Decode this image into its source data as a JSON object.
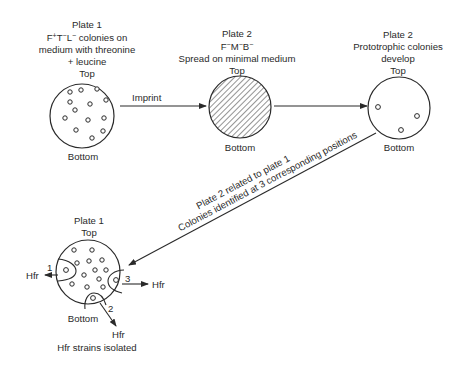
{
  "plate1_top": {
    "title": "Plate 1",
    "genotype": {
      "F": "F",
      "F_sup": "+",
      "T": "T",
      "T_sup": "−",
      "L": "L",
      "L_sup": "−",
      "rest": " colonies on"
    },
    "line2": "medium with threonine",
    "line3": "+ leucine",
    "top": "Top",
    "bottom": "Bottom"
  },
  "plate2_spread": {
    "title": "Plate 2",
    "genotype": {
      "F": "F",
      "F_sup": "−",
      "M": "M",
      "M_sup": "−",
      "B": "B",
      "B_sup": "−"
    },
    "line2": "Spread on minimal medium",
    "top": "Top",
    "bottom": "Bottom"
  },
  "plate2_result": {
    "title": "Plate 2",
    "line1": "Prototrophic colonies",
    "line2": "develop",
    "top": "Top",
    "bottom": "Bottom"
  },
  "arrows": {
    "imprint": "Imprint",
    "diagonal_line1": "Plate 2 related to plate 1",
    "diagonal_line2": "Colonies identified at 3 corresponding positions"
  },
  "plate1_bottom": {
    "title": "Plate 1",
    "top": "Top",
    "bottom": "Bottom",
    "positions": [
      {
        "number": "1",
        "label": "Hfr"
      },
      {
        "number": "2",
        "label": "Hfr"
      },
      {
        "number": "3",
        "label": "Hfr"
      }
    ],
    "caption": "Hfr strains isolated"
  },
  "colors": {
    "ink": "#2a2a2a",
    "background": "#ffffff"
  }
}
